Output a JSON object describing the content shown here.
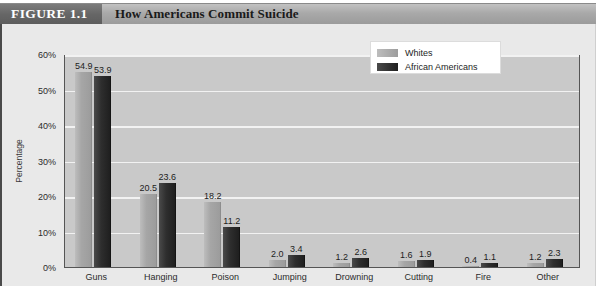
{
  "header": {
    "figure_tag": "FIGURE 1.1",
    "title": "How Americans Commit Suicide"
  },
  "legend": {
    "items": [
      {
        "label": "Whites",
        "color": "#a6a6a6",
        "swatch": "light"
      },
      {
        "label": "African Americans",
        "color": "#2e2e2e",
        "swatch": "dark"
      }
    ]
  },
  "footnote": {
    "text": ""
  },
  "chart_data": {
    "type": "bar",
    "title": "How Americans Commit Suicide",
    "xlabel": "",
    "ylabel": "Percentage",
    "ylim": [
      0,
      60
    ],
    "ytick_labels": [
      "0%",
      "10%",
      "20%",
      "30%",
      "40%",
      "50%",
      "60%"
    ],
    "ytick_values": [
      0,
      10,
      20,
      30,
      40,
      50,
      60
    ],
    "grid": true,
    "legend_position": "top-right",
    "categories": [
      "Guns",
      "Hanging",
      "Poison",
      "Jumping",
      "Drowning",
      "Cutting",
      "Fire",
      "Other"
    ],
    "series": [
      {
        "name": "Whites",
        "color": "#a6a6a6",
        "values": [
          54.9,
          20.5,
          18.2,
          2.0,
          1.2,
          1.6,
          0.4,
          1.2
        ]
      },
      {
        "name": "African Americans",
        "color": "#2e2e2e",
        "values": [
          53.9,
          23.6,
          11.2,
          3.4,
          2.6,
          1.9,
          1.1,
          2.3
        ]
      }
    ]
  }
}
